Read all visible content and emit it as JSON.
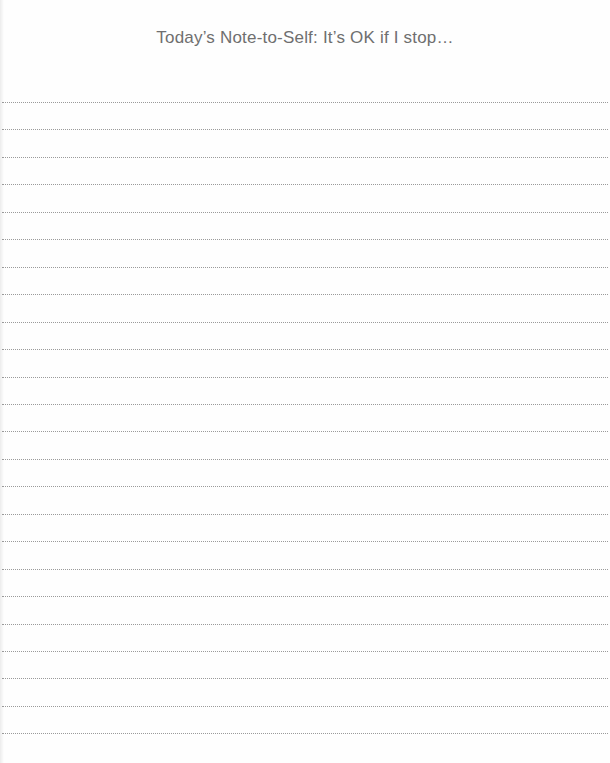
{
  "document": {
    "title": "Today’s Note-to-Self: It’s OK if I stop…",
    "ruled_lines": {
      "count": 24,
      "first_y": 102,
      "spacing": 27.45,
      "color": "#9a9a9a",
      "style": "dotted"
    },
    "background_color": "#fefefe",
    "title_color": "#6f6f6f"
  }
}
